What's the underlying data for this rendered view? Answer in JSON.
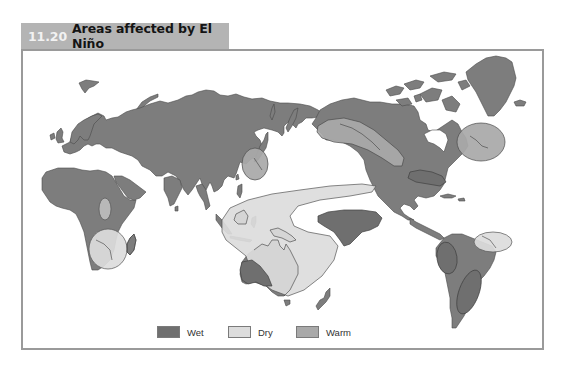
{
  "figure": {
    "number": "11.20",
    "title": "Areas affected by El Niño"
  },
  "colors": {
    "title_bar": "#b4b4b4",
    "frame_border": "#9a9a9a",
    "land": "#7d7d7d",
    "land_outline": "#4a4a4a",
    "wet": "#6f6f6f",
    "dry": "#dcdcdc",
    "warm": "#a9a9a9",
    "ocean": "#ffffff"
  },
  "map": {
    "projection": "Pacific-centered world map",
    "regions": [
      {
        "label": "Wet",
        "area": "Equatorial Pacific east of dateline (central Pacific)"
      },
      {
        "label": "Wet",
        "area": "Southern United States / Gulf coast"
      },
      {
        "label": "Wet",
        "area": "Western coast of South America (Ecuador/Peru)"
      },
      {
        "label": "Wet",
        "area": "Southeastern South America"
      },
      {
        "label": "Wet",
        "area": "Southwestern Australia"
      },
      {
        "label": "Dry",
        "area": "Indonesia, Papua New Guinea, eastern Australia, western Pacific"
      },
      {
        "label": "Dry",
        "area": "Southeastern Africa and Madagascar"
      },
      {
        "label": "Dry",
        "area": "Northeastern Brazil"
      },
      {
        "label": "Dry",
        "area": "East-central Africa"
      },
      {
        "label": "Warm",
        "area": "Alaska and western Canada"
      },
      {
        "label": "Warm",
        "area": "Eastern Canada (Labrador/Quebec)"
      },
      {
        "label": "Warm",
        "area": "Japan and Korea"
      }
    ]
  },
  "legend": {
    "items": [
      {
        "label": "Wet",
        "color": "#6f6f6f"
      },
      {
        "label": "Dry",
        "color": "#dcdcdc"
      },
      {
        "label": "Warm",
        "color": "#a9a9a9"
      }
    ]
  }
}
